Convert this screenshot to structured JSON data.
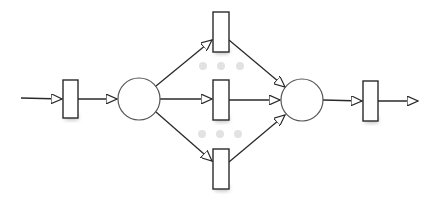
{
  "diagram": {
    "type": "petri-net",
    "colors": {
      "stroke": "#2a2a2a",
      "place_stroke": "#555555",
      "fill": "#ffffff",
      "shadow": "#bdbdbd",
      "ghost_dot": "#e2e2e2"
    },
    "places": [
      {
        "id": "p1",
        "cx": 139,
        "cy": 99,
        "r": 21
      },
      {
        "id": "p2",
        "cx": 302,
        "cy": 100,
        "r": 21
      }
    ],
    "transitions": [
      {
        "id": "t-in",
        "x": 63,
        "y": 80,
        "w": 15,
        "h": 38
      },
      {
        "id": "t-top",
        "x": 213,
        "y": 12,
        "w": 16,
        "h": 40
      },
      {
        "id": "t-mid",
        "x": 213,
        "y": 80,
        "w": 16,
        "h": 40
      },
      {
        "id": "t-bot",
        "x": 213,
        "y": 149,
        "w": 16,
        "h": 40
      },
      {
        "id": "t-out",
        "x": 363,
        "y": 81,
        "w": 15,
        "h": 40
      }
    ],
    "arcs": [
      {
        "id": "arc-source-tin",
        "x1": 21,
        "y1": 98,
        "x2": 62,
        "y2": 99
      },
      {
        "id": "arc-tin-p1",
        "x1": 78,
        "y1": 99,
        "x2": 117,
        "y2": 99
      },
      {
        "id": "arc-p1-ttop",
        "x1": 156,
        "y1": 86,
        "x2": 212,
        "y2": 40
      },
      {
        "id": "arc-p1-tmid",
        "x1": 160,
        "y1": 99,
        "x2": 212,
        "y2": 99
      },
      {
        "id": "arc-p1-tbot",
        "x1": 156,
        "y1": 112,
        "x2": 212,
        "y2": 161
      },
      {
        "id": "arc-ttop-p2",
        "x1": 229,
        "y1": 40,
        "x2": 285,
        "y2": 87
      },
      {
        "id": "arc-tmid-p2",
        "x1": 229,
        "y1": 100,
        "x2": 280,
        "y2": 100
      },
      {
        "id": "arc-tbot-p2",
        "x1": 229,
        "y1": 162,
        "x2": 285,
        "y2": 115
      },
      {
        "id": "arc-p2-tout",
        "x1": 323,
        "y1": 100,
        "x2": 362,
        "y2": 101
      },
      {
        "id": "arc-tout-sink",
        "x1": 378,
        "y1": 101,
        "x2": 418,
        "y2": 101
      }
    ],
    "ghost_dots": [
      {
        "cx": 203,
        "cy": 66
      },
      {
        "cx": 221,
        "cy": 66
      },
      {
        "cx": 240,
        "cy": 66
      },
      {
        "cx": 202,
        "cy": 134
      },
      {
        "cx": 220,
        "cy": 134
      },
      {
        "cx": 238,
        "cy": 134
      }
    ]
  }
}
